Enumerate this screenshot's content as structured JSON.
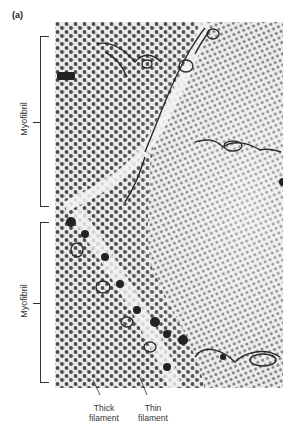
{
  "figure": {
    "panel_label": "(a)",
    "image_description": "Electron micrograph cross-section of skeletal muscle showing hexagonal arrays of thick and thin filaments in two myofibrils separated by sarcoplasmic reticulum membranes",
    "labels": {
      "upper_bracket": "Myofibril",
      "lower_bracket": "Myofibril",
      "thick_filament": [
        "Thick",
        "filament"
      ],
      "thin_filament": [
        "Thin",
        "filament"
      ]
    },
    "colors": {
      "background": "#ffffff",
      "micrograph_base": "#e9e9e9",
      "dots": "#4a4a4a",
      "membrane": "#2a2a2a",
      "text": "#333333"
    }
  }
}
